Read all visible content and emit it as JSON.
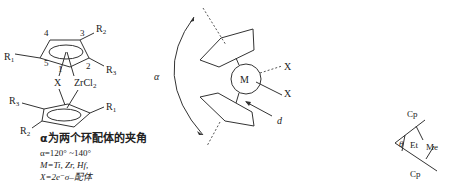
{
  "left_structure": {
    "top_ring_labels": {
      "pos1": "1",
      "pos2": "2",
      "pos3": "3",
      "pos4": "4",
      "pos5": "5",
      "R1": "R",
      "R1_sub": "1",
      "R2": "R",
      "R2_sub": "2",
      "R3": "R",
      "R3_sub": "3"
    },
    "bridge_label": "X",
    "metal_label": "ZrCl",
    "metal_sub": "2",
    "bottom_ring_labels": {
      "R1": "R",
      "R1_sub": "1",
      "R2": "R",
      "R2_sub": "2",
      "R3": "R",
      "R3_sub": "3"
    }
  },
  "caption": {
    "line1": "α为两个环配体的夹角",
    "line2": "α=120° ~140°",
    "line3": "M=Ti, Zr, Hf,",
    "line4": "X=2e⁻σ–配体"
  },
  "middle_structure": {
    "alpha_label": "α",
    "metal_label": "M",
    "ligand_x1": "X",
    "ligand_x2": "X",
    "distance_label": "d"
  },
  "right_structure": {
    "cp_top": "Cp",
    "cp_bottom": "Cp",
    "theta_label": "θ",
    "et_label": "Et",
    "me_label": "Me"
  },
  "colors": {
    "line": "#333333",
    "text": "#222222",
    "background": "#ffffff"
  }
}
